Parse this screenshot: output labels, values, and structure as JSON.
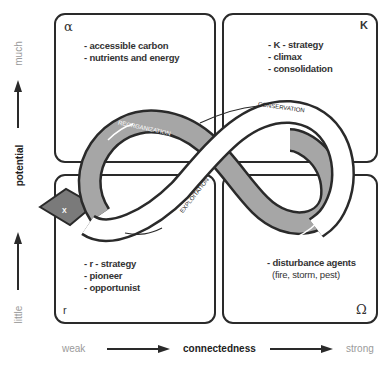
{
  "quadrants": {
    "top_left": {
      "symbol": "α",
      "items": [
        "- accessible carbon",
        "- nutrients and energy"
      ]
    },
    "top_right": {
      "symbol": "K",
      "items": [
        "- K - strategy",
        "- climax",
        "- consolidation"
      ]
    },
    "bottom_left": {
      "symbol": "r",
      "items": [
        "- r - strategy",
        "- pioneer",
        "- opportunist"
      ]
    },
    "bottom_right": {
      "symbol": "Ω",
      "items": [
        "- disturbance agents",
        "(fire, storm, pest)"
      ]
    }
  },
  "loop_labels": {
    "reorganization": "REORGANIZATION",
    "conservation": "CONSERVATION",
    "exploitation": "EXPLOITATION",
    "release": "RELEASE",
    "exit": "X"
  },
  "y_axis": {
    "title": "potential",
    "top": "much",
    "bottom": "little"
  },
  "x_axis": {
    "title": "connectedness",
    "left": "weak",
    "right": "strong"
  },
  "colors": {
    "shaded_loop": "#a6a6a6",
    "dark_exit": "#7a7a7a",
    "outline": "#2a2a2a"
  }
}
